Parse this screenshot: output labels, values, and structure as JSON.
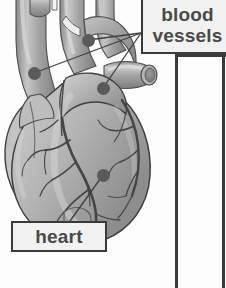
{
  "figure": {
    "style": "grayscale airbrush illustration",
    "background_color": "#fdfdfd"
  },
  "callouts": [
    {
      "id": "blood-vessels",
      "line1": "blood",
      "line2": "vessels",
      "text": "blood vessels",
      "box": {
        "x": 141,
        "y": -4,
        "w": 93,
        "h": 58
      },
      "border_color": "#3a3a3a",
      "fill_color": "#f2f2f2",
      "text_color": "#4a4a4a",
      "anchor": {
        "x": 141,
        "y": 33
      },
      "points": [
        {
          "x": 88,
          "y": 40
        },
        {
          "x": 34,
          "y": 73
        },
        {
          "x": 103,
          "y": 88
        }
      ]
    },
    {
      "id": "heart",
      "line1": "heart",
      "text": "heart",
      "box": {
        "x": 11,
        "y": 221,
        "w": 96,
        "h": 31
      },
      "border_color": "#3a3a3a",
      "fill_color": "#f2f2f2",
      "text_color": "#4a4a4a",
      "anchor": {
        "x": 70,
        "y": 221
      },
      "points": [
        {
          "x": 103,
          "y": 175
        }
      ]
    }
  ],
  "frame_lines": {
    "inner_x": 175,
    "outer_x": 222,
    "top_y": 54,
    "color": "#3a3a3a"
  },
  "palette": {
    "heart_light": "#c8c8c8",
    "heart_mid": "#a8a8a8",
    "heart_dark": "#8c8c8c",
    "vessel_dark": "#8a8a8a",
    "vessel_light": "#c4c4c4",
    "artery_line": "#4a4a4a",
    "dot_color": "#5a5a5a",
    "outline": "#3a3a3a"
  }
}
